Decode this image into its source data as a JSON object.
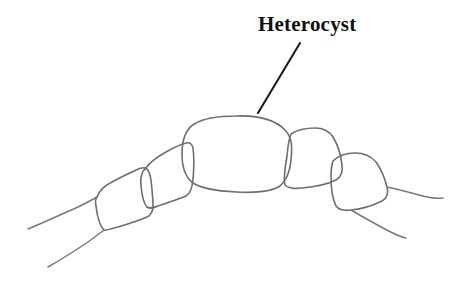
{
  "figure": {
    "title": "Heterocyst",
    "background_color": "#ffffff",
    "width": 454,
    "height": 281
  },
  "annotations": {
    "label": {
      "text": "Heterocyst",
      "color": "#111111",
      "x": 258,
      "y": 13,
      "font_size": 21,
      "font_weight": "bold"
    },
    "leader": {
      "name": "leader-line",
      "color": "#1a1a1a",
      "from_x": 300,
      "from_y": 43,
      "to_x": 258,
      "to_y": 113
    }
  },
  "structures": {
    "stroke_color": "#6e6e70",
    "tail_stroke_color": "#79797c",
    "stroke_width": 1.6,
    "heterocyst": {
      "name": "heterocyst-cell",
      "shape": "rounded-oval",
      "center_x": 236,
      "center_y": 153,
      "radius_x": 54,
      "radius_y": 38
    },
    "vegetative_cells": [
      {
        "name": "vegetative-cell-left-outer",
        "side": "left",
        "index": 1,
        "shape": "rounded-quadrilateral"
      },
      {
        "name": "vegetative-cell-left-inner",
        "side": "left",
        "index": 2,
        "shape": "rounded-quadrilateral"
      },
      {
        "name": "vegetative-cell-right-inner",
        "side": "right",
        "index": 1,
        "shape": "rounded-quadrilateral"
      },
      {
        "name": "vegetative-cell-right-outer",
        "side": "right",
        "index": 2,
        "shape": "rounded-quadrilateral"
      }
    ],
    "filament_tails": [
      {
        "name": "filament-tail-left-upper",
        "side": "left"
      },
      {
        "name": "filament-tail-left-lower",
        "side": "left"
      },
      {
        "name": "filament-tail-right-upper",
        "side": "right"
      },
      {
        "name": "filament-tail-right-lower",
        "side": "right"
      }
    ]
  }
}
